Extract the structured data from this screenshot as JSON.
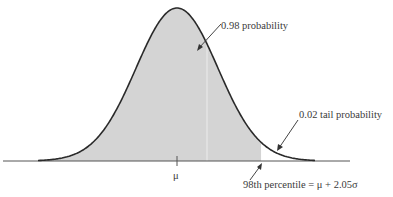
{
  "diagram": {
    "type": "normal-distribution",
    "labels": {
      "center_probability": "0.98 probability",
      "tail_probability": "0.02 tail probability",
      "mean": "μ",
      "percentile": "98th percentile = μ + 2.05σ"
    },
    "shaded_area": 0.98,
    "tail_area": 0.02,
    "z_value": 2.05,
    "colors": {
      "fill": "#d4d4d4",
      "curve": "#2a2a2a",
      "axis": "#555555"
    }
  }
}
